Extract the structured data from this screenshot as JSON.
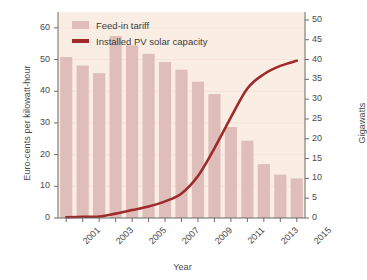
{
  "chart_data": {
    "type": "bar",
    "title": "",
    "subtitle": "",
    "xlabel": "Year",
    "ylabel": "Euro-cents per kilowatt-hour",
    "y2label": "Gigawatts",
    "grid": true,
    "legend_position": "top-left",
    "categories": [
      "2001",
      "2002",
      "2003",
      "2004",
      "2005",
      "2006",
      "2007",
      "2008",
      "2009",
      "2010",
      "2011",
      "2012",
      "2013",
      "2014",
      "2015"
    ],
    "xtick_labels": [
      "2001",
      "2003",
      "2005",
      "2007",
      "2009",
      "2011",
      "2013",
      "2015"
    ],
    "xlim": [
      2000.5,
      2015.5
    ],
    "ylim": [
      0,
      65
    ],
    "ytick_labels": [
      "0",
      "10",
      "20",
      "30",
      "40",
      "50",
      "60"
    ],
    "yticks": [
      0,
      10,
      20,
      30,
      40,
      50,
      60
    ],
    "y2lim": [
      0,
      52
    ],
    "y2tick_labels": [
      "0",
      "5",
      "10",
      "15",
      "20",
      "25",
      "30",
      "35",
      "40",
      "45",
      "50"
    ],
    "y2ticks": [
      0,
      5,
      10,
      15,
      20,
      25,
      30,
      35,
      40,
      45,
      50
    ],
    "series": [
      {
        "name": "Feed-in tariff",
        "type": "bar",
        "axis": "left",
        "color": "#dfbdb9",
        "values": [
          50.8,
          48.1,
          45.7,
          57.4,
          54.5,
          51.8,
          49.2,
          46.8,
          43.0,
          39.1,
          28.7,
          24.4,
          17.0,
          13.7,
          12.5
        ]
      },
      {
        "name": "Installed PV solar capacity",
        "type": "line",
        "axis": "right",
        "color": "#9e2a2a",
        "values": [
          0.2,
          0.3,
          0.4,
          1.1,
          2.0,
          2.9,
          4.2,
          6.2,
          10.6,
          17.6,
          25.4,
          32.7,
          36.3,
          38.4,
          39.7
        ]
      }
    ]
  },
  "legend": {
    "items": [
      {
        "label": "Feed-in tariff",
        "marker": "bar-swatch"
      },
      {
        "label": "Installed PV solar capacity",
        "marker": "line-swatch"
      }
    ]
  },
  "colors": {
    "plot_background": "#faeee4",
    "bar": "#dfbdb9",
    "line": "#9e2a2a",
    "axis": "#6b6b6b",
    "grid": "#f6e2d6",
    "text": "#3a3a3a",
    "page_background": "#ffffff"
  }
}
